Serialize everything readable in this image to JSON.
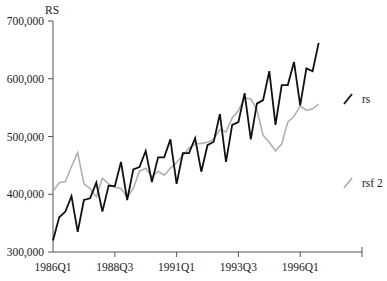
{
  "chart_data": {
    "type": "line",
    "title": "",
    "ylabel": "RS",
    "xlabel": "",
    "ylim": [
      300000,
      700000
    ],
    "yticks": [
      300000,
      400000,
      500000,
      600000,
      700000
    ],
    "ytick_labels": [
      "300,000",
      "400,000",
      "500,000",
      "600,000",
      "700,000"
    ],
    "xtick_labels": [
      "1986Q1",
      "1988Q3",
      "1991Q1",
      "1993Q3",
      "1996Q1"
    ],
    "xtick_indices": [
      0,
      10,
      20,
      30,
      40
    ],
    "x_end_index": 50,
    "grid": false,
    "legend_position": "right",
    "x": [
      "1986Q1",
      "1986Q2",
      "1986Q3",
      "1986Q4",
      "1987Q1",
      "1987Q2",
      "1987Q3",
      "1987Q4",
      "1988Q1",
      "1988Q2",
      "1988Q3",
      "1988Q4",
      "1989Q1",
      "1989Q2",
      "1989Q3",
      "1989Q4",
      "1990Q1",
      "1990Q2",
      "1990Q3",
      "1990Q4",
      "1991Q1",
      "1991Q2",
      "1991Q3",
      "1991Q4",
      "1992Q1",
      "1992Q2",
      "1992Q3",
      "1992Q4",
      "1993Q1",
      "1993Q2",
      "1993Q3",
      "1993Q4",
      "1994Q1",
      "1994Q2",
      "1994Q3",
      "1994Q4",
      "1995Q1",
      "1995Q2",
      "1995Q3",
      "1995Q4",
      "1996Q1",
      "1996Q2",
      "1996Q3",
      "1996Q4"
    ],
    "series": [
      {
        "name": "rs",
        "color": "#111111",
        "stroke_width": 1.8,
        "values": [
          320000,
          360000,
          370000,
          397000,
          335000,
          390000,
          393000,
          420000,
          370000,
          415000,
          414000,
          456000,
          390000,
          443000,
          447000,
          475000,
          421000,
          464000,
          464000,
          495000,
          418000,
          471000,
          471000,
          497000,
          439000,
          485000,
          491000,
          539000,
          456000,
          520000,
          525000,
          575000,
          495000,
          557000,
          563000,
          613000,
          520000,
          589000,
          589000,
          629000,
          554000,
          618000,
          613000,
          662000
        ]
      },
      {
        "name": "rsf 2",
        "color": "#b0b0b0",
        "stroke_width": 1.6,
        "values": [
          405000,
          420000,
          422000,
          448000,
          472000,
          418000,
          410000,
          395000,
          428000,
          418000,
          412000,
          410000,
          395000,
          410000,
          440000,
          445000,
          430000,
          440000,
          433000,
          445000,
          455000,
          467000,
          480000,
          487000,
          488000,
          490000,
          495000,
          512000,
          508000,
          532000,
          545000,
          567000,
          565000,
          546000,
          502000,
          490000,
          475000,
          487000,
          525000,
          535000,
          553000,
          545000,
          548000,
          556000
        ]
      }
    ]
  },
  "layout": {
    "plot_left": 53,
    "plot_right": 362,
    "plot_top": 21,
    "plot_bottom": 252
  },
  "legend": {
    "items": [
      {
        "label": "rs",
        "color": "#111111",
        "y": 99
      },
      {
        "label": "rsf 2",
        "color": "#b0b0b0",
        "y": 183
      }
    ]
  }
}
